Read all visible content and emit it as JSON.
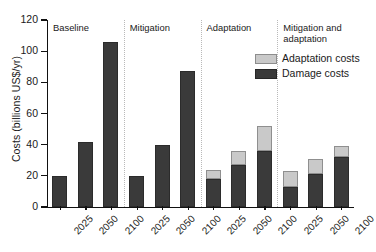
{
  "chart_data": {
    "type": "bar",
    "subtype": "stacked-grouped-bar",
    "title": "",
    "xlabel": "",
    "ylabel": "Costs (billions US$/yr)",
    "ylim": [
      0,
      120
    ],
    "yticks": [
      0,
      20,
      40,
      60,
      80,
      100,
      120
    ],
    "ytick_labels": [
      "0",
      "20",
      "40",
      "60",
      "80",
      "100",
      "120"
    ],
    "grid": false,
    "legend_position": "upper-right-inside",
    "categories": [
      "2025",
      "2050",
      "2100",
      "2025",
      "2050",
      "2100",
      "2025",
      "2050",
      "2100",
      "2025",
      "2050",
      "2100"
    ],
    "groups": [
      {
        "label": "Baseline",
        "years": [
          "2025",
          "2050",
          "2100"
        ]
      },
      {
        "label": "Mitigation",
        "years": [
          "2025",
          "2050",
          "2100"
        ]
      },
      {
        "label": "Adaptation",
        "years": [
          "2025",
          "2050",
          "2100"
        ]
      },
      {
        "label": "Mitigation and\nadaptation",
        "years": [
          "2025",
          "2050",
          "2100"
        ]
      }
    ],
    "series": [
      {
        "name": "Damage costs",
        "color": "#3a3a3a",
        "values": [
          20,
          42,
          106,
          20,
          40,
          87,
          18,
          27,
          36,
          13,
          21,
          32
        ]
      },
      {
        "name": "Adaptation costs",
        "color": "#c9c9c9",
        "values": [
          0,
          0,
          0,
          0,
          0,
          0,
          6,
          9,
          16,
          10,
          10,
          7
        ]
      }
    ],
    "totals": [
      20,
      42,
      106,
      20,
      40,
      87,
      24,
      36,
      52,
      23,
      31,
      39
    ],
    "legend": [
      {
        "label": "Adaptation costs",
        "color": "#c9c9c9"
      },
      {
        "label": "Damage costs",
        "color": "#3a3a3a"
      }
    ]
  }
}
